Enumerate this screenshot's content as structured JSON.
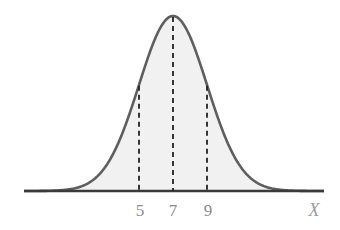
{
  "chart_data": {
    "type": "line",
    "title": "",
    "distribution": {
      "name": "normal",
      "mean": 7,
      "sd": 2
    },
    "xlabel": "X",
    "ylabel": "",
    "x_ticks": [
      "5",
      "7",
      "9"
    ],
    "reference_lines": [
      {
        "x": 5,
        "style": "dashed"
      },
      {
        "x": 7,
        "style": "dashed"
      },
      {
        "x": 9,
        "style": "dashed"
      }
    ],
    "xlim": [
      -1.7,
      15.8
    ],
    "grid": false,
    "legend": null,
    "colors": {
      "curve": "#5a5a5a",
      "fill": "#f0f0f0",
      "axis": "#333333",
      "dashed": "#222222",
      "labels": "#8a8a8a"
    }
  },
  "labels": {
    "tick5": "5",
    "tick7": "7",
    "tick9": "9",
    "xaxis": "X"
  }
}
